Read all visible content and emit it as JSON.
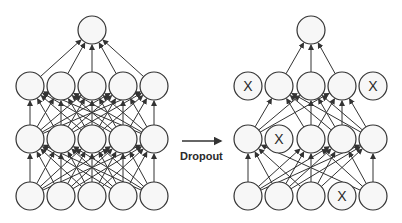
{
  "diagram": {
    "title": "Dropout",
    "arrow_label": "Dropout",
    "colors": {
      "node_fill": "#f7f7f7",
      "stroke": "#333333",
      "text": "#2a2a2a"
    },
    "left_network": {
      "name": "Standard neural net",
      "xs": [
        30,
        61,
        92,
        123,
        154
      ],
      "top_x": 92,
      "layers": [
        {
          "name": "output",
          "y": 30,
          "count": 1,
          "dropped": []
        },
        {
          "name": "hidden2",
          "y": 86,
          "count": 5,
          "dropped": []
        },
        {
          "name": "hidden1",
          "y": 139,
          "count": 5,
          "dropped": []
        },
        {
          "name": "input",
          "y": 196,
          "count": 5,
          "dropped": []
        }
      ]
    },
    "right_network": {
      "name": "After applying dropout",
      "xs": [
        248,
        279,
        311,
        342,
        373
      ],
      "top_x": 311,
      "layers": [
        {
          "name": "output",
          "y": 30,
          "count": 1,
          "dropped": []
        },
        {
          "name": "hidden2",
          "y": 86,
          "count": 5,
          "dropped": [
            0,
            4
          ]
        },
        {
          "name": "hidden1",
          "y": 139,
          "count": 5,
          "dropped": [
            1
          ]
        },
        {
          "name": "input",
          "y": 196,
          "count": 5,
          "dropped": [
            3
          ]
        }
      ]
    },
    "dropped_marker": "X",
    "node_radius": 14
  }
}
